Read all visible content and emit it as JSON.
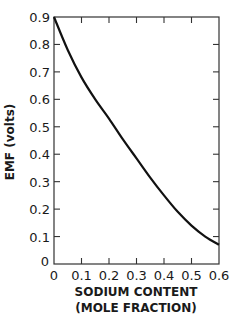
{
  "chart_data": {
    "type": "line",
    "title": "",
    "xlabel": "SODIUM CONTENT (MOLE FRACTION)",
    "xlabel_line1": "SODIUM CONTENT",
    "xlabel_line2": "(MOLE FRACTION)",
    "ylabel": "EMF (volts)",
    "xlim": [
      0,
      0.6
    ],
    "ylim": [
      0,
      0.9
    ],
    "xticks": [
      "0",
      "0.1",
      "0.2",
      "0.3",
      "0.4",
      "0.5",
      "0.6"
    ],
    "yticks": [
      "0",
      "0.1",
      "0.2",
      "0.3",
      "0.4",
      "0.5",
      "0.6",
      "0.7",
      "0.8",
      "0.9"
    ],
    "grid": false,
    "legend": null,
    "series": [
      {
        "name": "EMF",
        "x": [
          0,
          0.05,
          0.1,
          0.15,
          0.2,
          0.25,
          0.3,
          0.35,
          0.4,
          0.45,
          0.5,
          0.55,
          0.6
        ],
        "y": [
          0.9,
          0.78,
          0.68,
          0.6,
          0.53,
          0.455,
          0.385,
          0.315,
          0.25,
          0.19,
          0.14,
          0.1,
          0.07
        ]
      }
    ]
  }
}
